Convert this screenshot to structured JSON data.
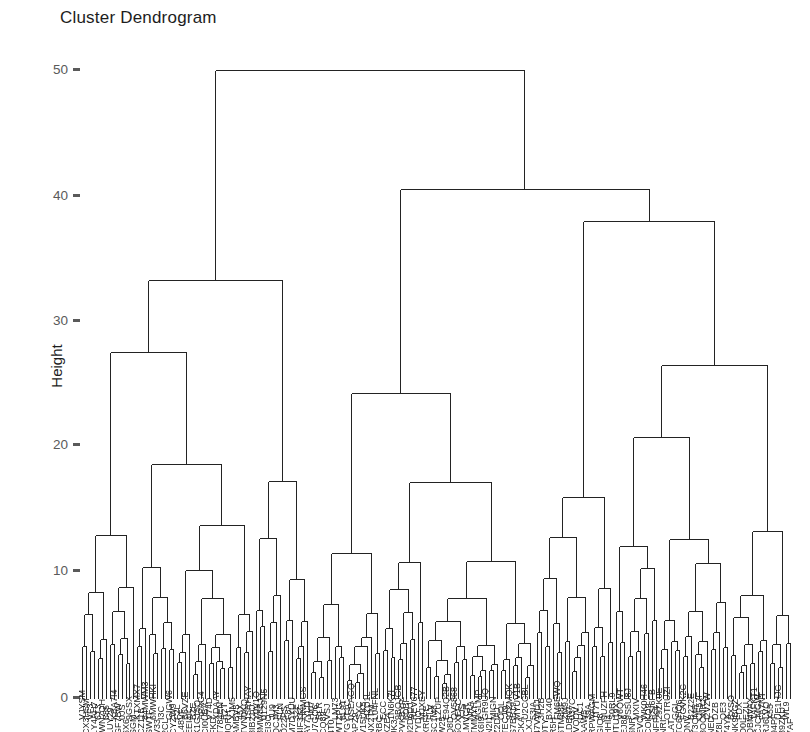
{
  "chart_data": {
    "type": "dendrogram",
    "title": "Cluster Dendrogram",
    "xlabel": "",
    "ylabel": "Height",
    "ylim": [
      0,
      52
    ],
    "yticks": [
      0,
      10,
      20,
      30,
      40,
      50
    ],
    "ytick_labels": [
      "0",
      "10",
      "20",
      "30",
      "40",
      "50"
    ],
    "grid": false,
    "legend": null,
    "orientation": "vertical",
    "leaf_count": 180,
    "leaf_labels_legible": false,
    "leaf_labels_note": "dense overlapping rotated leaf labels, illegible at this resolution",
    "line_color": "#232323",
    "background": "#ffffff",
    "axis_text_color": "#5a5a5a",
    "notable_merges": [
      {
        "height": 50.0,
        "note": "root"
      },
      {
        "height": 40.5,
        "note": "right major cluster"
      },
      {
        "height": 38.0,
        "note": "far-right cluster"
      },
      {
        "height": 33.3,
        "note": "left major cluster"
      },
      {
        "height": 27.2,
        "note": "left sub-cluster"
      },
      {
        "height": 26.5,
        "note": "far-right sub-cluster"
      },
      {
        "height": 24.3,
        "note": "middle cluster"
      },
      {
        "height": 21.0,
        "note": "middle sub-cluster"
      },
      {
        "height": 19.8,
        "note": "left branch"
      },
      {
        "height": 18.8,
        "note": "left branch"
      },
      {
        "height": 17.9,
        "note": "left branch"
      },
      {
        "height": 17.9,
        "note": "middle branch"
      },
      {
        "height": 17.3,
        "note": "right branch"
      },
      {
        "height": 16.0,
        "note": "right branch"
      },
      {
        "height": 14.7,
        "note": "middle branch"
      },
      {
        "height": 14.3,
        "note": "left branch"
      },
      {
        "height": 13.9,
        "note": "right branch"
      },
      {
        "height": 13.1,
        "note": "right branch"
      },
      {
        "height": 12.9,
        "note": "right branch"
      },
      {
        "height": 12.2,
        "note": "left branch"
      },
      {
        "height": 11.9,
        "note": "right branch"
      },
      {
        "height": 11.6,
        "note": "right branch"
      },
      {
        "height": 10.9,
        "note": "middle branch"
      },
      {
        "height": 10.5,
        "note": "left branch"
      },
      {
        "height": 10.4,
        "note": "right branch"
      },
      {
        "height": 10.1,
        "note": "right branch"
      },
      {
        "height": 9.5,
        "note": "middle branch"
      },
      {
        "height": 9.3,
        "note": "right branch"
      },
      {
        "height": 8.9,
        "note": "left branch"
      },
      {
        "height": 8.1,
        "note": "left branch"
      }
    ]
  },
  "plot": {
    "title": "Cluster Dendrogram",
    "ylabel": "Height",
    "ytick_labels": [
      "50",
      "40",
      "30",
      "20",
      "10",
      "0"
    ]
  }
}
